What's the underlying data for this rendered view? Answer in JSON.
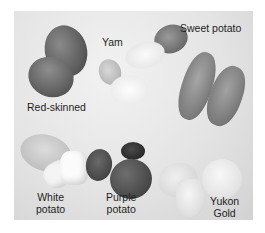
{
  "image": {
    "subject": "Varieties of potatoes (grayscale photograph)",
    "labels": {
      "yam": "Yam",
      "sweet_potato": "Sweet potato",
      "red_skinned": "Red-skinned",
      "white_potato": [
        "White",
        "potato"
      ],
      "purple_potato": [
        "Purple",
        "potato"
      ],
      "yukon_gold": [
        "Yukon",
        "Gold"
      ]
    }
  }
}
